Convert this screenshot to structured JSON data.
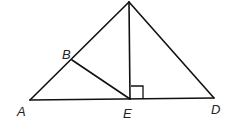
{
  "diagram": {
    "type": "geometry",
    "points": {
      "apex": {
        "x": 129,
        "y": 2,
        "label": ""
      },
      "A": {
        "x": 30,
        "y": 100,
        "label": "A"
      },
      "B": {
        "x": 72,
        "y": 60,
        "label": "B"
      },
      "E": {
        "x": 130,
        "y": 99,
        "label": "E"
      },
      "D": {
        "x": 214,
        "y": 98,
        "label": "D"
      }
    },
    "labels": {
      "A": "A",
      "B": "B",
      "E": "E",
      "D": "D"
    },
    "segments": [
      [
        "A",
        "apex"
      ],
      [
        "apex",
        "D"
      ],
      [
        "A",
        "D"
      ],
      [
        "apex",
        "E"
      ],
      [
        "B",
        "E"
      ]
    ],
    "right_angle_marker": {
      "at": "E",
      "between": [
        "apex",
        "D"
      ]
    },
    "colors": {
      "stroke": "#111111",
      "background": "#ffffff"
    }
  }
}
